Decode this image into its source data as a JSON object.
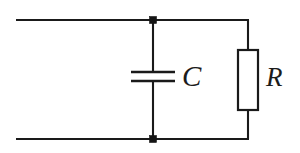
{
  "figure": {
    "background_color": "#ffffff",
    "line_color": "#1a1a1a",
    "node_color": "#141414",
    "width": 300,
    "height": 153
  },
  "labels": {
    "capacitor": "C",
    "resistor": "R"
  },
  "components": [
    {
      "id": "capacitor",
      "type": "capacitor",
      "label": "C",
      "symbol": "two-parallel-plates",
      "branch": "middle",
      "x": 152,
      "y": 76
    },
    {
      "id": "resistor",
      "type": "resistor",
      "label": "R",
      "symbol": "rectangle-box",
      "branch": "right",
      "x": 248,
      "y": 80
    }
  ],
  "nodes": [
    {
      "id": "top-junction",
      "x": 153,
      "y": 20,
      "shape": "filled-square"
    },
    {
      "id": "bottom-junction",
      "x": 153,
      "y": 139,
      "shape": "filled-square"
    }
  ],
  "wires": [
    {
      "id": "top-rail",
      "from_x": 16,
      "from_y": 20,
      "to_x": 248,
      "to_y": 20,
      "orientation": "horizontal"
    },
    {
      "id": "bottom-rail",
      "from_x": 16,
      "from_y": 139,
      "to_x": 248,
      "to_y": 139,
      "orientation": "horizontal"
    },
    {
      "id": "capacitor-upper-lead",
      "from_x": 153,
      "from_y": 20,
      "to_x": 153,
      "to_y": 72,
      "orientation": "vertical"
    },
    {
      "id": "capacitor-lower-lead",
      "from_x": 153,
      "from_y": 81,
      "to_x": 153,
      "to_y": 139,
      "orientation": "vertical"
    },
    {
      "id": "resistor-upper-lead",
      "from_x": 248,
      "from_y": 20,
      "to_x": 248,
      "to_y": 50,
      "orientation": "vertical"
    },
    {
      "id": "resistor-lower-lead",
      "from_x": 248,
      "from_y": 110,
      "to_x": 248,
      "to_y": 139,
      "orientation": "vertical"
    }
  ],
  "capacitor_plates": [
    {
      "id": "plate-top",
      "x1": 131,
      "x2": 175,
      "y": 72
    },
    {
      "id": "plate-bottom",
      "x1": 131,
      "x2": 175,
      "y": 81
    }
  ],
  "resistor_box": {
    "x": 238,
    "y": 50,
    "width": 20,
    "height": 60
  }
}
